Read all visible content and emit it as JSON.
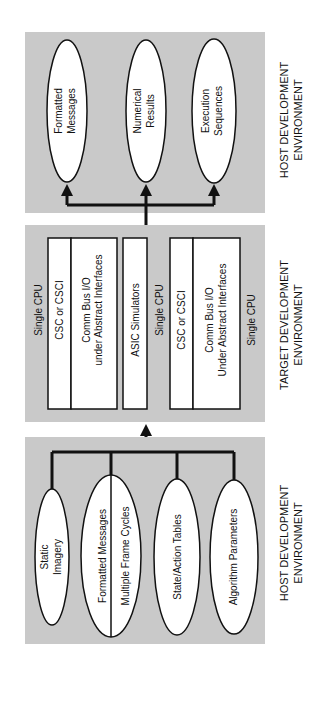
{
  "diagram": {
    "colors": {
      "panel": "#c9c9c9",
      "stroke": "#111111",
      "node": "#ffffff"
    },
    "panels": [
      {
        "id": "top",
        "label_line1": "HOST DEVELOPMENT",
        "label_line2": "ENVIRONMENT",
        "nodes": [
          {
            "line1": "Formatted",
            "line2": "Messages"
          },
          {
            "line1": "Numerical",
            "line2": "Results"
          },
          {
            "line1": "Execution",
            "line2": "Sequences"
          }
        ]
      },
      {
        "id": "middle",
        "label_line1": "TARGET DEVELOPMENT",
        "label_line2": "ENVIRONMENT",
        "cpu1": {
          "label": "Single CPU",
          "csc": "CSC or CSCI",
          "comm_line1": "Comm Bus I/O",
          "comm_line2": "under Abstract Interfaces"
        },
        "asic": {
          "label": "ASIC Simulators",
          "cpu_label": "Single CPU"
        },
        "cpu2": {
          "label": "Single CPU",
          "csc": "CSC or CSCI",
          "comm_line1": "Comm Bus I/O",
          "comm_line2": "Under Abstract Interfaces"
        }
      },
      {
        "id": "bottom",
        "label_line1": "HOST DEVELOPMENT",
        "label_line2": "ENVIRONMENT",
        "nodes": [
          {
            "line1": "Static",
            "line2": "Imagery"
          },
          {
            "line1": "Formatted Messages",
            "line2": "Multiple Frame Cycles"
          },
          {
            "line1": "State/Action Tables"
          },
          {
            "line1": "Algorithm Parameters"
          }
        ]
      }
    ]
  }
}
